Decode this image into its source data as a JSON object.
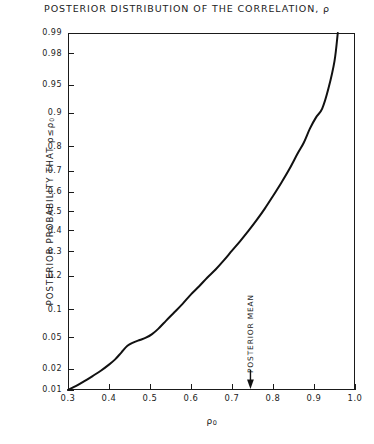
{
  "figure": {
    "title": "POSTERIOR DISTRIBUTION OF THE CORRELATION, ρ",
    "y_axis_label": "POSTERIOR PROBABILITY THAT ρ≤ρ₀",
    "x_axis_label": "ρ₀",
    "annotation_label": "POSTERIOR MEAN",
    "annotation_arrow_icon": "down-arrow-icon",
    "line_color": "#111111",
    "frame_color": "#1a1a1a",
    "background_color": "#ffffff"
  },
  "chart_data": {
    "type": "line",
    "title": "POSTERIOR DISTRIBUTION OF THE CORRELATION, ρ",
    "xlabel": "ρ₀",
    "ylabel": "POSTERIOR PROBABILITY THAT ρ≤ρ₀",
    "x_scale": "linear",
    "y_scale": "probability (normal probit)",
    "xlim": [
      0.3,
      1.0
    ],
    "ylim": [
      0.01,
      0.99
    ],
    "grid": false,
    "legend": null,
    "xticks": [
      "0.3",
      "0.4",
      "0.5",
      "0.6",
      "0.7",
      "0.8",
      "0.9",
      "1.0"
    ],
    "xtick_values": [
      0.3,
      0.4,
      0.5,
      0.6,
      0.7,
      0.8,
      0.9,
      1.0
    ],
    "yticks": [
      "0.01",
      "0.02",
      "0.05",
      "0.1",
      "0.2",
      "0.3",
      "0.4",
      "0.5",
      "0.6",
      "0.7",
      "0.8",
      "0.9",
      "0.95",
      "0.98",
      "0.99"
    ],
    "ytick_values": [
      0.01,
      0.02,
      0.05,
      0.1,
      0.2,
      0.3,
      0.4,
      0.5,
      0.6,
      0.7,
      0.8,
      0.9,
      0.95,
      0.98,
      0.99
    ],
    "series": [
      {
        "name": "Posterior CDF of ρ",
        "x": [
          0.3,
          0.32,
          0.34,
          0.36,
          0.38,
          0.4,
          0.415,
          0.43,
          0.445,
          0.46,
          0.475,
          0.49,
          0.505,
          0.52,
          0.54,
          0.56,
          0.58,
          0.6,
          0.62,
          0.64,
          0.66,
          0.68,
          0.7,
          0.72,
          0.74,
          0.76,
          0.78,
          0.8,
          0.82,
          0.84,
          0.86,
          0.875,
          0.89,
          0.905,
          0.92,
          0.935,
          0.95,
          0.958
        ],
        "y": [
          0.01,
          0.0115,
          0.0135,
          0.016,
          0.019,
          0.023,
          0.027,
          0.033,
          0.04,
          0.044,
          0.047,
          0.05,
          0.055,
          0.063,
          0.078,
          0.095,
          0.115,
          0.14,
          0.165,
          0.195,
          0.225,
          0.262,
          0.305,
          0.35,
          0.4,
          0.455,
          0.515,
          0.58,
          0.645,
          0.71,
          0.775,
          0.815,
          0.86,
          0.89,
          0.91,
          0.945,
          0.975,
          0.99
        ]
      }
    ],
    "annotations": [
      {
        "label": "POSTERIOR MEAN",
        "x": 0.745,
        "orientation": "vertical",
        "arrow": "down"
      }
    ]
  }
}
